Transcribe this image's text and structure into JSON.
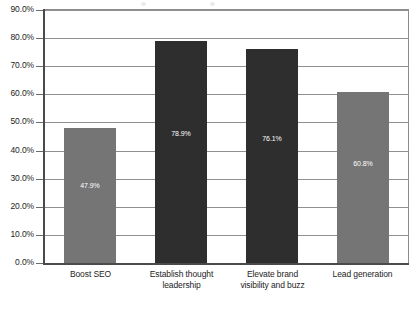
{
  "chart_data": {
    "type": "bar",
    "title": "",
    "subtitle": "",
    "xlabel": "",
    "ylabel": "",
    "ylim": [
      0,
      90
    ],
    "grid": true,
    "legend": "none",
    "orientation": "vertical",
    "value_suffix": "%",
    "categories": [
      "Boost SEO",
      "Establish thought leadership",
      "Elevate brand visibility and buzz",
      "Lead generation"
    ],
    "category_lines": [
      [
        "Boost SEO"
      ],
      [
        "Establish thought",
        "leadership"
      ],
      [
        "Elevate brand",
        "visibility and buzz"
      ],
      [
        "Lead generation"
      ]
    ],
    "values": [
      47.9,
      78.9,
      76.1,
      60.8
    ],
    "value_labels": [
      "47.9%",
      "78.9%",
      "76.1%",
      "60.8%"
    ],
    "bar_colors": [
      "#757575",
      "#2e2e2e",
      "#2e2e2e",
      "#757575"
    ],
    "ytick_values": [
      90,
      80,
      70,
      60,
      50,
      40,
      30,
      20,
      10,
      0
    ],
    "ytick_labels": [
      "90.0%",
      "80.0%",
      "70.0%",
      "60.0%",
      "50.0%",
      "40.0%",
      "30.0%",
      "20.0%",
      "10.0%",
      "0.0%"
    ]
  },
  "style": {
    "plot_background": "#ffffff",
    "grid_color": "#8f8f8f",
    "axis_color": "#4a4a4a",
    "frame_color": "#8c8c8c",
    "text_color": "#1d1d1d",
    "value_label_color": "#ffffff"
  }
}
